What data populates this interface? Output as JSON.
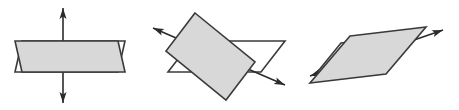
{
  "figure": {
    "kind": "geometry-diagram",
    "caption": "",
    "canvas": {
      "width": 459,
      "height": 110,
      "background": "#ffffff"
    },
    "style": {
      "stroke": "#3a3a3a",
      "stroke_width": 1.6,
      "shaded_fill": "#d8d8d8",
      "unshaded_fill": "#ffffff",
      "arrow_color": "#2b2b2b"
    },
    "panels": [
      {
        "id": "panel-1",
        "name": "vertical-axis-pair-of-planes",
        "label": "",
        "arrow": {
          "name": "vertical-double-arrow",
          "orientation": "vertical",
          "double_headed": true,
          "from": [
            63,
            8
          ],
          "to": [
            63,
            103
          ]
        },
        "shaded_plane": {
          "name": "shaded-parallelogram",
          "fill": "#d8d8d8",
          "points": [
            [
              15,
              41
            ],
            [
              118,
              41
            ],
            [
              125,
              72
            ],
            [
              22,
              72
            ]
          ]
        },
        "unshaded_plane": {
          "name": "unshaded-parallelogram",
          "fill": "#ffffff",
          "points": [
            [
              22,
              41
            ],
            [
              125,
              41
            ],
            [
              118,
              72
            ],
            [
              15,
              72
            ]
          ]
        }
      },
      {
        "id": "panel-2",
        "name": "oblique-axis-pair-of-planes",
        "label": "",
        "arrow": {
          "name": "oblique-double-arrow",
          "orientation": "diagonal-down-right",
          "double_headed": true,
          "from": [
            153,
            28
          ],
          "to": [
            285,
            85
          ]
        },
        "shaded_plane": {
          "name": "shaded-parallelogram",
          "fill": "#d8d8d8",
          "points": [
            [
              195,
              13
            ],
            [
              255,
              62
            ],
            [
              226,
              100
            ],
            [
              166,
              51
            ]
          ]
        },
        "unshaded_plane": {
          "name": "unshaded-parallelogram",
          "fill": "#ffffff",
          "points": [
            [
              192,
              41
            ],
            [
              285,
              41
            ],
            [
              261,
              72
            ],
            [
              168,
              72
            ]
          ]
        }
      },
      {
        "id": "panel-3",
        "name": "tilted-axis-pair-of-planes",
        "label": "",
        "arrow": {
          "name": "tilted-double-arrow",
          "orientation": "diagonal-up-right",
          "double_headed": true,
          "from": [
            310,
            76
          ],
          "to": [
            443,
            30
          ]
        },
        "shaded_plane": {
          "name": "shaded-parallelogram",
          "fill": "#d8d8d8",
          "points": [
            [
              350,
              36
            ],
            [
              426,
              27
            ],
            [
              386,
              74
            ],
            [
              310,
              83
            ]
          ]
        },
        "unshaded_plane": {
          "name": "unshaded-parallelogram",
          "fill": "#ffffff",
          "points": [
            [
              341,
              43
            ],
            [
              417,
              34
            ],
            [
              391,
              66
            ],
            [
              315,
              75
            ]
          ]
        }
      }
    ]
  }
}
